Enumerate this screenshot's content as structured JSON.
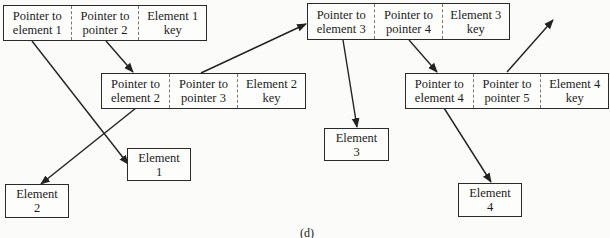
{
  "nodes": [
    {
      "ptr_elem": [
        "Pointer to",
        "element 1"
      ],
      "ptr_ptr": [
        "Pointer to",
        "pointer 2"
      ],
      "key": [
        "Element 1",
        "key"
      ]
    },
    {
      "ptr_elem": [
        "Pointer to",
        "element 2"
      ],
      "ptr_ptr": [
        "Pointer to",
        "pointer 3"
      ],
      "key": [
        "Element 2",
        "key"
      ]
    },
    {
      "ptr_elem": [
        "Pointer to",
        "element 3"
      ],
      "ptr_ptr": [
        "Pointer to",
        "pointer 4"
      ],
      "key": [
        "Element 3",
        "key"
      ]
    },
    {
      "ptr_elem": [
        "Pointer to",
        "element 4"
      ],
      "ptr_ptr": [
        "Pointer to",
        "pointer 5"
      ],
      "key": [
        "Element 4",
        "key"
      ]
    }
  ],
  "elements": [
    {
      "line1": "Element",
      "line2": "1"
    },
    {
      "line1": "Element",
      "line2": "2"
    },
    {
      "line1": "Element",
      "line2": "3"
    },
    {
      "line1": "Element",
      "line2": "4"
    }
  ],
  "caption": "(d)",
  "cut_text": "... Q... ... ... ..."
}
